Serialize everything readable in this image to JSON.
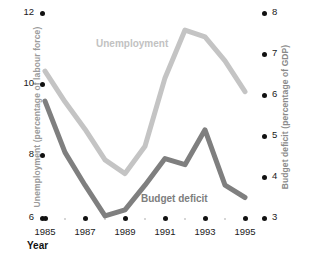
{
  "chart_data": {
    "type": "line",
    "title": "",
    "xlabel": "Year",
    "x": [
      1985,
      1986,
      1987,
      1988,
      1989,
      1990,
      1991,
      1992,
      1993,
      1994,
      1995
    ],
    "xtick_labels": [
      "1985",
      "1987",
      "1989",
      "1991",
      "1993",
      "1995"
    ],
    "xtick_values": [
      1985,
      1987,
      1989,
      1991,
      1993,
      1995
    ],
    "xlim": [
      1985,
      1995
    ],
    "grid": false,
    "legend_position": "inline-annotations",
    "series": [
      {
        "name": "Unemployment",
        "axis": "left",
        "color": "#c4c4c4",
        "ylabel": "Unemployment (percentage of labour force)",
        "ytick_labels": [
          "12",
          "10",
          "8",
          "6"
        ],
        "ytick_values": [
          12,
          10,
          8,
          6
        ],
        "ylim": [
          6,
          12
        ],
        "values": [
          10.3,
          9.4,
          8.6,
          7.7,
          7.3,
          8.1,
          10.1,
          11.5,
          11.3,
          10.6,
          9.7
        ]
      },
      {
        "name": "Budget deficit",
        "axis": "right",
        "color": "#7f7f7f",
        "ylabel": "Budget deficit (percentage of GDP)",
        "ytick_labels": [
          "8",
          "7",
          "6",
          "5",
          "4",
          "3"
        ],
        "ytick_values": [
          8,
          7,
          6,
          5,
          4,
          3
        ],
        "ylim": [
          3,
          8
        ],
        "values": [
          5.85,
          4.6,
          3.8,
          3.05,
          3.2,
          3.8,
          4.45,
          4.3,
          5.15,
          3.8,
          3.5
        ]
      }
    ],
    "annotations": [
      {
        "text": "Unemployment",
        "color": "#c2c2c2"
      },
      {
        "text": "Budget deficit",
        "color": "#7d7d7d"
      }
    ]
  },
  "axes": {
    "left": {
      "title": "Unemployment (percentage of labour force)",
      "ticks": [
        {
          "label": "12",
          "y": 13
        },
        {
          "label": "10",
          "y": 84
        },
        {
          "label": "8",
          "y": 155
        },
        {
          "label": "6",
          "y": 218
        }
      ]
    },
    "right": {
      "title": "Budget deficit (percentage of GDP)",
      "ticks": [
        {
          "label": "8",
          "y": 13
        },
        {
          "label": "7",
          "y": 54
        },
        {
          "label": "6",
          "y": 95
        },
        {
          "label": "5",
          "y": 136
        },
        {
          "label": "4",
          "y": 177
        },
        {
          "label": "3",
          "y": 218
        }
      ]
    },
    "bottom": {
      "title": "Year",
      "ticks": [
        {
          "label": "1985",
          "x": 45
        },
        {
          "label": "1987",
          "x": 85
        },
        {
          "label": "1989",
          "x": 125
        },
        {
          "label": "1991",
          "x": 165
        },
        {
          "label": "1993",
          "x": 205
        },
        {
          "label": "1995",
          "x": 245
        }
      ],
      "minor_tick_x": [
        65,
        105,
        145,
        185,
        225
      ]
    }
  },
  "colors": {
    "unemployment_line": "#c4c4c4",
    "deficit_line": "#7f7f7f",
    "tick_dot": "#111111",
    "minor_dot": "#c9c9c9",
    "axis_title": "#9b9b9b",
    "background": "#ffffff"
  }
}
